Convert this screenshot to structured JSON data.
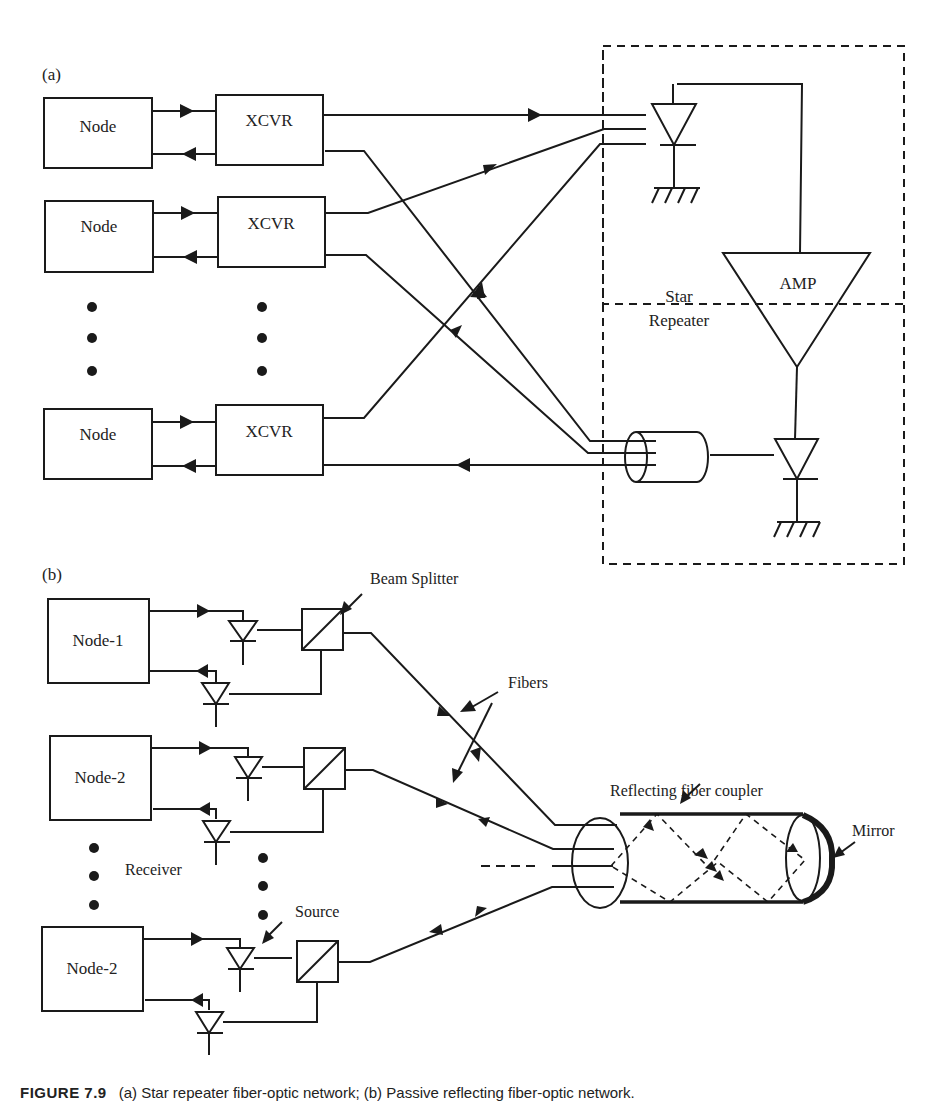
{
  "figure": {
    "caption_label": "FIGURE 7.9",
    "caption_text": "(a) Star repeater fiber-optic network; (b) Passive reflecting fiber-optic network."
  },
  "panel_a": {
    "label": "(a)",
    "nodes": [
      "Node",
      "Node",
      "Node"
    ],
    "transceivers": [
      "XCVR",
      "XCVR",
      "XCVR"
    ],
    "repeater_label_line1": "Star",
    "repeater_label_line2": "Repeater",
    "amplifier": "AMP"
  },
  "panel_b": {
    "label": "(b)",
    "nodes": [
      "Node-1",
      "Node-2",
      "Node-2"
    ],
    "beam_splitter": "Beam Splitter",
    "fibers": "Fibers",
    "coupler": "Reflecting fiber coupler",
    "mirror": "Mirror",
    "receiver": "Receiver",
    "source": "Source"
  },
  "colors": {
    "ink": "#1a1a1a",
    "background": "#ffffff"
  }
}
